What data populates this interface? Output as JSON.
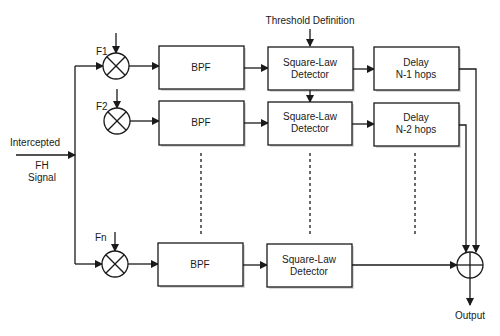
{
  "diagram": {
    "threshold_label": "Threshold Definition",
    "input_label_line1": "Intercepted",
    "input_label_line2": "FH",
    "input_label_line3": "Signal",
    "output_label": "Output",
    "channels": [
      {
        "freq_label": "F1",
        "filter_label": "BPF",
        "detector_line1": "Square-Law",
        "detector_line2": "Detector",
        "delay_line1": "Delay",
        "delay_line2": "N-1 hops"
      },
      {
        "freq_label": "F2",
        "filter_label": "BPF",
        "detector_line1": "Square-Law",
        "detector_line2": "Detector",
        "delay_line1": "Delay",
        "delay_line2": "N-2 hops"
      },
      {
        "freq_label": "Fn",
        "filter_label": "BPF",
        "detector_line1": "Square-Law",
        "detector_line2": "Detector"
      }
    ],
    "colors": {
      "stroke": "#1a1a1a",
      "background": "#ffffff"
    }
  }
}
